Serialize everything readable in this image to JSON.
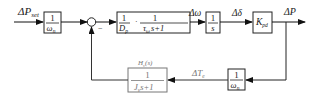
{
  "diagram": {
    "type": "control-block-diagram",
    "input": {
      "label": "ΔP",
      "sub": "set"
    },
    "blocks": {
      "input_scale": {
        "num": "1",
        "den": "ω",
        "den_sub": "n"
      },
      "plant": {
        "num1": "1",
        "den1": "D",
        "den1_sub": "p",
        "sep": "·",
        "num2": "1",
        "den2": "τ",
        "den2_sub": "ω",
        "den2_tail": "s+1"
      },
      "integrator": {
        "num": "1",
        "den": "s"
      },
      "gain": {
        "label": "K",
        "sub": "pd"
      },
      "feedback_scale": {
        "num": "1",
        "den": "ω",
        "den_sub": "n"
      },
      "virtual_inertia": {
        "title": "H",
        "title_sub": "v",
        "title_tail": "(s)",
        "num": "1",
        "den": "J",
        "den_sub": "v",
        "den_tail": "s+1"
      }
    },
    "signals": {
      "omega": {
        "label": "Δω"
      },
      "delta": {
        "label": "Δδ"
      },
      "output": {
        "label": "ΔP"
      },
      "torque": {
        "label": "ΔT",
        "sub": "e"
      }
    },
    "summing_junction": {
      "sign_feedback": "−"
    },
    "colors": {
      "main": "#222222",
      "feedback_block": "#777777"
    }
  }
}
